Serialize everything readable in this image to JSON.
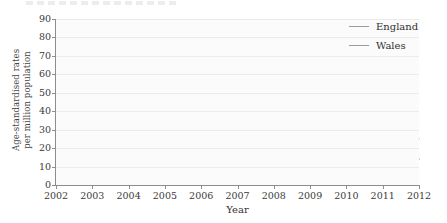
{
  "chart_data": {
    "type": "line",
    "title": "",
    "xlabel": "Year",
    "ylabel": "Age-standardised rates per million population",
    "ylabel_line1": "Age-standardised rates",
    "ylabel_line2": "per million population",
    "x": [
      2002,
      2003,
      2004,
      2005,
      2006,
      2007,
      2008,
      2009,
      2010,
      2011,
      2012
    ],
    "xlim": [
      2002,
      2012
    ],
    "ylim": [
      0,
      90
    ],
    "yticks": [
      0,
      10,
      20,
      30,
      40,
      50,
      60,
      70,
      80,
      90
    ],
    "xticks": [
      "2002",
      "2003",
      "2004",
      "2005",
      "2006",
      "2007",
      "2008",
      "2009",
      "2010",
      "2011",
      "2012"
    ],
    "grid": true,
    "legend_position": "top-right",
    "series": [
      {
        "name": "England",
        "color": "#9a9a9a",
        "values": [
          15,
          16,
          21,
          27,
          40,
          61,
          83,
          68,
          46,
          32,
          25
        ]
      },
      {
        "name": "Wales",
        "color": "#9a9a9a",
        "values": [
          15,
          14,
          15,
          17,
          27,
          66,
          78,
          60,
          60,
          40,
          14
        ]
      }
    ]
  },
  "legend": {
    "items": [
      {
        "label": "England"
      },
      {
        "label": "Wales"
      }
    ]
  },
  "axes": {
    "x_title": "Year",
    "y_title_line1": "Age-standardised rates",
    "y_title_line2": "per million population"
  }
}
